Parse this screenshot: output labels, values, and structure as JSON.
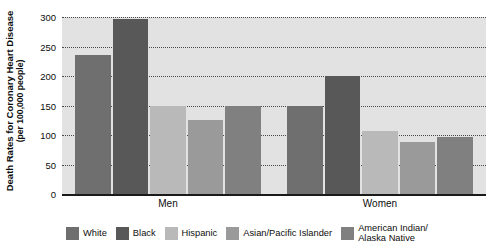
{
  "chart_data": {
    "type": "bar",
    "title": "",
    "ylabel": "Death Rates for Coronary Heart Disease\n(per 100,000 people)",
    "ylabel_line1": "Death Rates for Coronary Heart Disease",
    "ylabel_line2": "(per 100,000 people)",
    "xlabel": "",
    "categories": [
      "Men",
      "Women"
    ],
    "ylim": [
      0,
      300
    ],
    "yticks": [
      0,
      50,
      100,
      150,
      200,
      250,
      300
    ],
    "ytick_labels": [
      "0",
      "50",
      "100",
      "150",
      "200",
      "250",
      "300"
    ],
    "grid": "horizontal-dotted",
    "legend_position": "bottom",
    "series": [
      {
        "name": "White",
        "color": "#6f6f6f",
        "values": [
          235,
          150
        ]
      },
      {
        "name": "Black",
        "color": "#585858",
        "values": [
          296,
          200
        ]
      },
      {
        "name": "Hispanic",
        "color": "#b9b9b9",
        "values": [
          150,
          106
        ]
      },
      {
        "name": "Asian/Pacific Islander",
        "color": "#9a9a9a",
        "values": [
          126,
          88
        ]
      },
      {
        "name": "American Indian/\nAlaska Native",
        "color": "#808080",
        "values": [
          150,
          97
        ]
      }
    ],
    "plot_background": "#e2e2e2",
    "axis_color": "#1a1a1a",
    "gridline_color": "#4a4a4a"
  }
}
